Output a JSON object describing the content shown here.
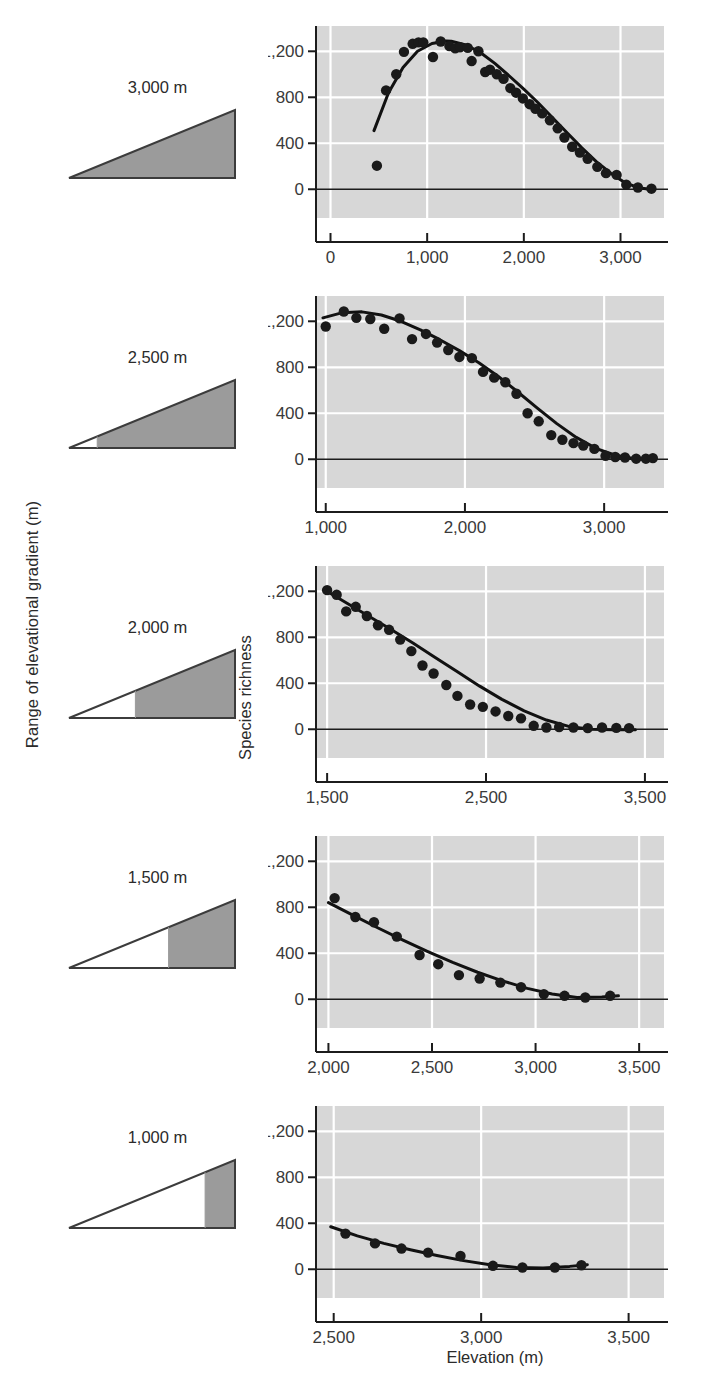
{
  "figure": {
    "y_axis_outer_label": "Range of elevational gradient (m)",
    "y_axis_inner_label": "Species richness",
    "x_axis_label": "Elevation (m)",
    "marker_color": "#1a1a1a",
    "curve_color": "#111111",
    "plot_background": "#d7d7d7",
    "gridline_color": "#ffffff",
    "triangle_fill": "#9b9b9b",
    "triangle_stroke": "#3c3c3c"
  },
  "gradient_icons": [
    {
      "label": "3,000 m",
      "shaded_from_fraction": 0.0
    },
    {
      "label": "2,500 m",
      "shaded_from_fraction": 0.17
    },
    {
      "label": "2,000 m",
      "shaded_from_fraction": 0.4
    },
    {
      "label": "1,500 m",
      "shaded_from_fraction": 0.6
    },
    {
      "label": "1,000 m",
      "shaded_from_fraction": 0.82
    }
  ],
  "chart_data": [
    {
      "type": "scatter",
      "title": "3,000 m",
      "xlabel": "",
      "ylabel": "Species richness",
      "xlim": [
        -150,
        3450
      ],
      "ylim": [
        -250,
        1420
      ],
      "xticks": [
        0,
        1000,
        2000,
        3000
      ],
      "xticklabels": [
        "0",
        "1,000",
        "2,000",
        "3,000"
      ],
      "yticks": [
        0,
        400,
        800,
        1200
      ],
      "yticklabels": [
        "0",
        "400",
        "800",
        "1,200"
      ],
      "grid": true,
      "x": [
        480,
        575,
        680,
        760,
        850,
        910,
        960,
        1060,
        1140,
        1230,
        1290,
        1340,
        1420,
        1460,
        1530,
        1600,
        1650,
        1720,
        1790,
        1860,
        1920,
        1990,
        2060,
        2120,
        2190,
        2270,
        2350,
        2420,
        2500,
        2580,
        2660,
        2760,
        2850,
        2960,
        3060,
        3180,
        3320
      ],
      "y": [
        205,
        860,
        1000,
        1195,
        1265,
        1278,
        1278,
        1150,
        1285,
        1245,
        1225,
        1235,
        1230,
        1115,
        1200,
        1020,
        1040,
        1000,
        960,
        880,
        840,
        790,
        740,
        700,
        660,
        600,
        530,
        450,
        370,
        320,
        265,
        195,
        140,
        125,
        40,
        15,
        5
      ],
      "fit_curve": {
        "x": [
          450,
          600,
          750,
          900,
          1050,
          1200,
          1250,
          1400,
          1550,
          1700,
          1850,
          2000,
          2150,
          2300,
          2450,
          2600,
          2750,
          2900,
          3050,
          3200,
          3350
        ],
        "y": [
          510,
          840,
          1060,
          1200,
          1268,
          1290,
          1288,
          1255,
          1190,
          1095,
          985,
          870,
          750,
          620,
          490,
          360,
          240,
          140,
          55,
          10,
          -5
        ]
      }
    },
    {
      "type": "scatter",
      "title": "2,500 m",
      "xlabel": "",
      "ylabel": "Species richness",
      "xlim": [
        930,
        3430
      ],
      "ylim": [
        -250,
        1420
      ],
      "xticks": [
        1000,
        2000,
        3000
      ],
      "xticklabels": [
        "1,000",
        "2,000",
        "3,000"
      ],
      "yticks": [
        0,
        400,
        800,
        1200
      ],
      "yticklabels": [
        "0",
        "400",
        "800",
        "1,200"
      ],
      "grid": true,
      "x": [
        1000,
        1130,
        1220,
        1320,
        1420,
        1530,
        1620,
        1720,
        1800,
        1880,
        1960,
        2050,
        2130,
        2210,
        2290,
        2370,
        2450,
        2530,
        2620,
        2700,
        2780,
        2850,
        2930,
        3010,
        3080,
        3150,
        3230,
        3300,
        3350
      ],
      "y": [
        1155,
        1285,
        1230,
        1220,
        1135,
        1225,
        1045,
        1090,
        1015,
        950,
        890,
        880,
        760,
        710,
        670,
        570,
        400,
        330,
        210,
        170,
        140,
        120,
        90,
        30,
        20,
        15,
        5,
        5,
        10
      ],
      "fit_curve": {
        "x": [
          980,
          1120,
          1260,
          1400,
          1540,
          1680,
          1820,
          1960,
          2100,
          2240,
          2380,
          2520,
          2660,
          2800,
          2940,
          3080,
          3220,
          3360
        ],
        "y": [
          1230,
          1275,
          1282,
          1255,
          1200,
          1125,
          1040,
          945,
          840,
          720,
          585,
          445,
          310,
          190,
          95,
          35,
          5,
          -5
        ]
      }
    },
    {
      "type": "scatter",
      "title": "2,000 m",
      "xlabel": "",
      "ylabel": "Species richness",
      "xlim": [
        1430,
        3620
      ],
      "ylim": [
        -250,
        1420
      ],
      "xticks": [
        1500,
        2500,
        3500
      ],
      "xticklabels": [
        "1,500",
        "2,500",
        "3,500"
      ],
      "yticks": [
        0,
        400,
        800,
        1200
      ],
      "yticklabels": [
        "0",
        "400",
        "800",
        "1,200"
      ],
      "grid": true,
      "x": [
        1500,
        1560,
        1620,
        1680,
        1750,
        1820,
        1890,
        1960,
        2030,
        2100,
        2170,
        2250,
        2320,
        2400,
        2480,
        2560,
        2640,
        2720,
        2800,
        2880,
        2960,
        3050,
        3140,
        3230,
        3320,
        3400
      ],
      "y": [
        1210,
        1170,
        1025,
        1065,
        985,
        905,
        865,
        780,
        680,
        555,
        485,
        385,
        290,
        215,
        195,
        155,
        115,
        95,
        30,
        15,
        20,
        15,
        10,
        15,
        12,
        10
      ],
      "fit_curve": {
        "x": [
          1480,
          1620,
          1760,
          1900,
          2040,
          2180,
          2320,
          2460,
          2600,
          2740,
          2880,
          3020,
          3160,
          3300,
          3440
        ],
        "y": [
          1215,
          1100,
          985,
          870,
          750,
          625,
          500,
          375,
          260,
          160,
          80,
          25,
          0,
          -5,
          -5
        ]
      }
    },
    {
      "type": "scatter",
      "title": "1,500 m",
      "xlabel": "",
      "ylabel": "Species richness",
      "xlim": [
        1940,
        3620
      ],
      "ylim": [
        -250,
        1420
      ],
      "xticks": [
        2000,
        2500,
        3000,
        3500
      ],
      "xticklabels": [
        "2,000",
        "2,500",
        "3,000",
        "3,500"
      ],
      "yticks": [
        0,
        400,
        800,
        1200
      ],
      "yticklabels": [
        "0",
        "400",
        "800",
        "1,200"
      ],
      "grid": true,
      "x": [
        2030,
        2130,
        2220,
        2330,
        2440,
        2530,
        2630,
        2730,
        2830,
        2930,
        3040,
        3140,
        3240,
        3360
      ],
      "y": [
        880,
        715,
        670,
        545,
        385,
        305,
        210,
        180,
        145,
        105,
        45,
        30,
        15,
        30
      ],
      "fit_curve": {
        "x": [
          2000,
          2120,
          2240,
          2360,
          2480,
          2600,
          2720,
          2840,
          2960,
          3080,
          3200,
          3320,
          3400
        ],
        "y": [
          840,
          730,
          620,
          515,
          415,
          320,
          235,
          160,
          95,
          45,
          15,
          20,
          30
        ]
      }
    },
    {
      "type": "scatter",
      "title": "1,000 m",
      "xlabel": "Elevation (m)",
      "ylabel": "Species richness",
      "xlim": [
        2440,
        3620
      ],
      "ylim": [
        -250,
        1420
      ],
      "xticks": [
        2500,
        3000,
        3500
      ],
      "xticklabels": [
        "2,500",
        "3,000",
        "3,500"
      ],
      "yticks": [
        0,
        400,
        800,
        1200
      ],
      "yticklabels": [
        "0",
        "400",
        "800",
        "1,200"
      ],
      "grid": true,
      "x": [
        2540,
        2640,
        2730,
        2820,
        2930,
        3040,
        3140,
        3250,
        3340
      ],
      "y": [
        310,
        225,
        180,
        145,
        115,
        30,
        15,
        15,
        35
      ],
      "fit_curve": {
        "x": [
          2490,
          2580,
          2670,
          2760,
          2850,
          2940,
          3030,
          3120,
          3210,
          3300,
          3360
        ],
        "y": [
          370,
          290,
          225,
          170,
          120,
          75,
          40,
          15,
          10,
          25,
          40
        ]
      }
    }
  ]
}
